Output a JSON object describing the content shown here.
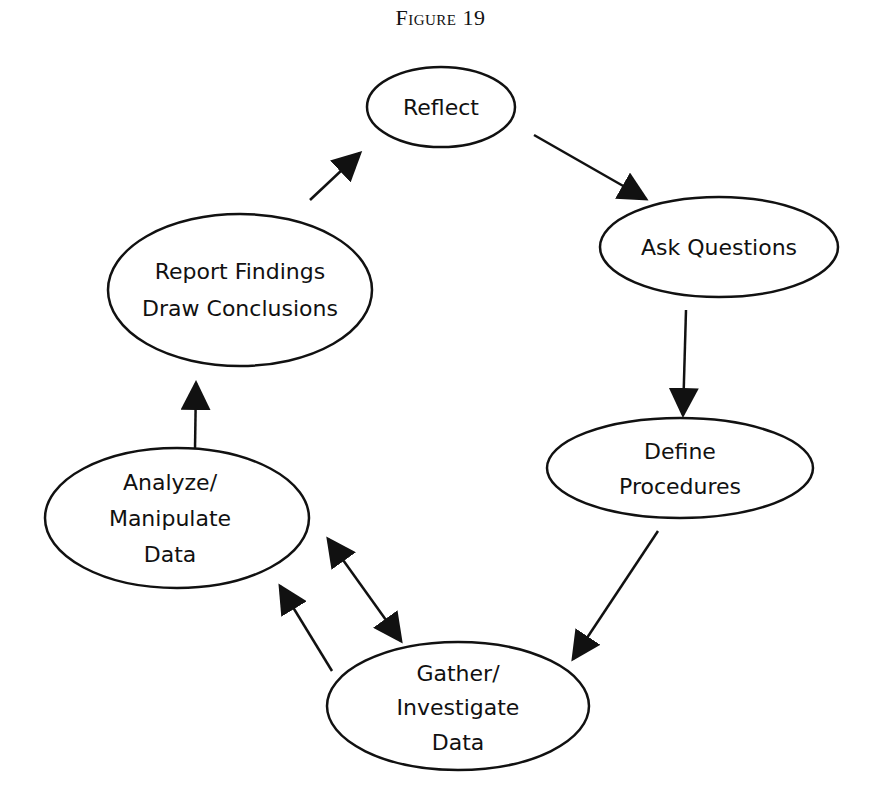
{
  "figure": {
    "caption": "Figure 19"
  },
  "diagram": {
    "type": "cycle",
    "nodes": [
      {
        "id": "reflect",
        "lines": [
          "Reflect"
        ],
        "cx": 441,
        "cy": 107,
        "rx": 74,
        "ry": 40
      },
      {
        "id": "ask_questions",
        "lines": [
          "Ask Questions"
        ],
        "cx": 719,
        "cy": 247,
        "rx": 119,
        "ry": 50
      },
      {
        "id": "define_procedures",
        "lines": [
          "Define",
          "Procedures"
        ],
        "cx": 680,
        "cy": 468,
        "rx": 133,
        "ry": 50
      },
      {
        "id": "gather_investigate",
        "lines": [
          "Gather/",
          "Investigate",
          "Data"
        ],
        "cx": 458,
        "cy": 706,
        "rx": 131,
        "ry": 64
      },
      {
        "id": "analyze_manipulate",
        "lines": [
          "Analyze/",
          "Manipulate",
          "Data"
        ],
        "cx": 177,
        "cy": 518,
        "rx": 132,
        "ry": 70
      },
      {
        "id": "report_findings",
        "lines": [
          "Report Findings",
          "Draw Conclusions"
        ],
        "cx": 240,
        "cy": 290,
        "rx": 132,
        "ry": 76
      }
    ],
    "edges": [
      {
        "from": "reflect",
        "to": "ask_questions",
        "direction": "forward"
      },
      {
        "from": "ask_questions",
        "to": "define_procedures",
        "direction": "forward"
      },
      {
        "from": "define_procedures",
        "to": "gather_investigate",
        "direction": "forward"
      },
      {
        "from": "gather_investigate",
        "to": "analyze_manipulate",
        "direction": "forward"
      },
      {
        "from": "analyze_manipulate",
        "to": "gather_investigate",
        "direction": "both"
      },
      {
        "from": "analyze_manipulate",
        "to": "report_findings",
        "direction": "forward"
      },
      {
        "from": "report_findings",
        "to": "reflect",
        "direction": "forward"
      }
    ]
  },
  "labels": {
    "reflect": [
      "Reflect"
    ],
    "ask_questions": [
      "Ask Questions"
    ],
    "define_procedures": [
      "Define",
      "Procedures"
    ],
    "gather_investigate": [
      "Gather/",
      "Investigate",
      "Data"
    ],
    "analyze_manipulate": [
      "Analyze/",
      "Manipulate",
      "Data"
    ],
    "report_findings": [
      "Report Findings",
      "Draw Conclusions"
    ]
  },
  "colors": {
    "stroke": "#111111",
    "background": "#ffffff",
    "text": "#111111"
  }
}
